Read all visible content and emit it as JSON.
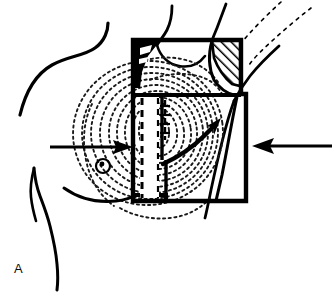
{
  "figure": {
    "panel_label": "A",
    "panel_label_x": 14,
    "panel_label_y": 262,
    "domain": "anatomical-line-drawing",
    "background_color": "#ffffff",
    "ink_color": "#000000",
    "dotted_color": "#1a1a1a"
  },
  "body_outline": {
    "neck_shoulder_label": "neck and shoulder contour",
    "arm_torso_label": "arm and lateral torso contour",
    "upper_arm_label": "upper arm lines",
    "midline_label": "sternal midline"
  },
  "breast_contour": {
    "label": "breast contour lines",
    "style": "dotted concentric",
    "ring_count": 11,
    "nipple_label": "nipple marker",
    "nipple_x": 103,
    "nipple_y": 166,
    "nipple_r": 6
  },
  "field_box": {
    "label": "surgical field outline",
    "upper_box": {
      "x": 131,
      "y": 38,
      "w": 112,
      "h": 58
    },
    "lower_box": {
      "x": 131,
      "y": 96,
      "w": 117,
      "h": 107
    },
    "stroke_width": 4
  },
  "hatched_region": {
    "label": "hatched resection zone",
    "style": "diagonal hatching",
    "position": "upper-right corner of field box"
  },
  "solid_region": {
    "label": "solid black wedge",
    "position": "upper-left corner of field box"
  },
  "flap": {
    "label": "skin flap strip",
    "style": "dashed outline",
    "x": 139,
    "y": 97,
    "w": 20,
    "h": 103
  },
  "arrows": [
    {
      "name": "left-traction-arrow",
      "direction": "right",
      "tail_x": 50,
      "tail_y": 147,
      "head_x": 130,
      "head_y": 147
    },
    {
      "name": "right-traction-arrow",
      "direction": "left",
      "tail_x": 330,
      "tail_y": 146,
      "head_x": 250,
      "head_y": 146
    },
    {
      "name": "rotation-arrow",
      "direction": "up-right curved",
      "tail_x": 163,
      "tail_y": 163,
      "head_x": 218,
      "head_y": 125
    }
  ]
}
